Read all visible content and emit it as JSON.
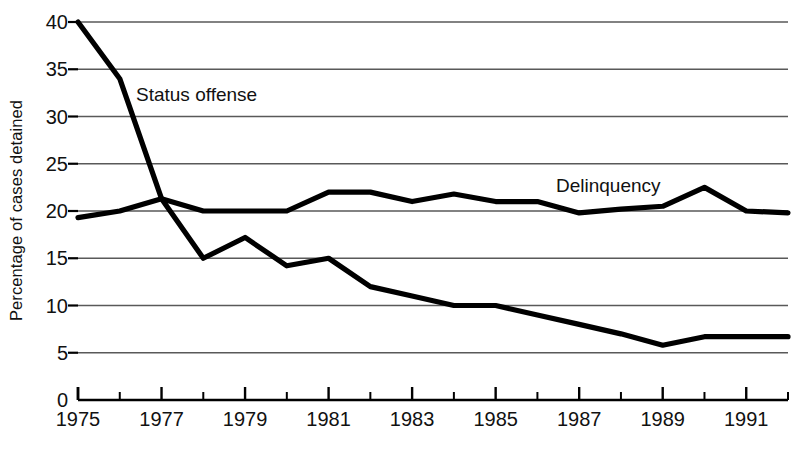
{
  "chart_data": {
    "type": "line",
    "title": "",
    "subtitle": "",
    "xlabel": "",
    "ylabel": "Percentage of cases detained",
    "xlim": [
      1975,
      1992
    ],
    "ylim": [
      0,
      40
    ],
    "ytick_step": 5,
    "xtick_step": 1,
    "xtick_label_step": 2,
    "grid": "horizontal",
    "legend_position": "inline-annotations",
    "x": [
      1975,
      1976,
      1977,
      1978,
      1979,
      1980,
      1981,
      1982,
      1983,
      1984,
      1985,
      1986,
      1987,
      1988,
      1989,
      1990,
      1991,
      1992
    ],
    "ytick_labels": [
      "0",
      "5",
      "10",
      "15",
      "20",
      "25",
      "30",
      "35",
      "40"
    ],
    "ytick_values": [
      0,
      5,
      10,
      15,
      20,
      25,
      30,
      35,
      40
    ],
    "xtick_labels": [
      "1975",
      "1977",
      "1979",
      "1981",
      "1983",
      "1985",
      "1987",
      "1989",
      "1991"
    ],
    "xtick_label_values": [
      1975,
      1977,
      1979,
      1981,
      1983,
      1985,
      1987,
      1989,
      1991
    ],
    "series": [
      {
        "name": "Status offense",
        "label": "Status offense",
        "color": "#000000",
        "values": [
          40.0,
          34.0,
          21.3,
          15.0,
          17.2,
          14.2,
          15.0,
          12.0,
          11.0,
          10.0,
          10.0,
          9.0,
          8.0,
          7.0,
          5.8,
          6.7,
          6.7,
          6.7
        ]
      },
      {
        "name": "Delinquency",
        "label": "Delinquency",
        "color": "#000000",
        "values": [
          19.3,
          20.0,
          21.3,
          20.0,
          20.0,
          20.0,
          22.0,
          22.0,
          21.0,
          21.8,
          21.0,
          21.0,
          19.8,
          20.2,
          20.5,
          22.5,
          20.0,
          19.8
        ]
      }
    ],
    "colors": {
      "line": "#000000",
      "grid": "#595959",
      "axis": "#000000",
      "text": "#111111",
      "background": "#ffffff"
    }
  }
}
